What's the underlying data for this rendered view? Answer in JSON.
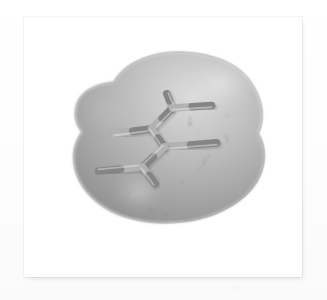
{
  "figure": {
    "kind": "molecular-surface-rendering",
    "caption": "",
    "alt_text": "Grayscale rendering of a molecular van der Waals surface enclosing a stick model of a branched alkane",
    "background_color": "#fefefe",
    "plate_background": "#ffffff",
    "frame": {
      "x": 24,
      "y": 17,
      "width": 278,
      "height": 260,
      "border_color": "#e8e8e8",
      "shadow_color": "rgba(0,0,0,0.12)"
    }
  },
  "surface": {
    "name": "van-der-waals-surface",
    "fill_light": "#cfcfcf",
    "fill_mid": "#a8a8a8",
    "fill_dark": "#8f8f8f",
    "edge_color": "#9a9a9a",
    "highlight_color": "#eaeaea",
    "outline_path": "M 104 72 C 118 48, 152 34, 190 36 C 228 38, 258 52, 272 76 C 284 96, 286 116, 278 134 C 288 150, 288 172, 276 192 C 260 218, 224 236, 186 240 C 146 244, 108 236, 84 216 C 66 201, 56 182, 56 162 C 56 150, 60 140, 66 132 C 58 122, 56 110, 60 98 C 66 82, 84 74, 104 72 Z",
    "highlights": [
      {
        "name": "upper-right-specular",
        "cx": 232,
        "cy": 74,
        "rx": 46,
        "ry": 34,
        "intensity": 0.72
      },
      {
        "name": "lower-center-specular",
        "cx": 134,
        "cy": 204,
        "rx": 30,
        "ry": 21,
        "intensity": 0.62
      },
      {
        "name": "left-lobe-soft",
        "cx": 92,
        "cy": 108,
        "rx": 34,
        "ry": 28,
        "intensity": 0.3
      }
    ]
  },
  "molecule": {
    "name": "stick-model",
    "bond_color_light": "#b2b2b2",
    "bond_color_dark": "#858585",
    "bond_width": 9,
    "atoms": [
      {
        "id": "C1",
        "label": "",
        "x": 104,
        "y": 134
      },
      {
        "id": "C2",
        "label": "",
        "x": 150,
        "y": 128
      },
      {
        "id": "C3",
        "label": "",
        "x": 175,
        "y": 103
      },
      {
        "id": "C4",
        "label": "",
        "x": 168,
        "y": 86
      },
      {
        "id": "C5",
        "label": "",
        "x": 222,
        "y": 100
      },
      {
        "id": "C6",
        "label": "",
        "x": 165,
        "y": 150
      },
      {
        "id": "C7",
        "label": "",
        "x": 228,
        "y": 145
      },
      {
        "id": "C8",
        "label": "",
        "x": 139,
        "y": 174
      },
      {
        "id": "C9",
        "label": "",
        "x": 86,
        "y": 179
      },
      {
        "id": "C10",
        "label": "",
        "x": 154,
        "y": 194
      }
    ],
    "bonds": [
      {
        "from": "C1",
        "to": "C2",
        "name": "bond-c1-c2"
      },
      {
        "from": "C2",
        "to": "C3",
        "name": "bond-c2-c3"
      },
      {
        "from": "C3",
        "to": "C4",
        "name": "bond-c3-c4"
      },
      {
        "from": "C3",
        "to": "C5",
        "name": "bond-c3-c5"
      },
      {
        "from": "C2",
        "to": "C6",
        "name": "bond-c2-c6"
      },
      {
        "from": "C6",
        "to": "C7",
        "name": "bond-c6-c7"
      },
      {
        "from": "C6",
        "to": "C8",
        "name": "bond-c6-c8"
      },
      {
        "from": "C8",
        "to": "C9",
        "name": "bond-c8-c9"
      },
      {
        "from": "C8",
        "to": "C10",
        "name": "bond-c8-c10"
      }
    ]
  },
  "artifacts": {
    "specks": [
      {
        "x": 197,
        "y": 122,
        "r": 1.1
      },
      {
        "x": 205,
        "y": 131,
        "r": 0.8
      },
      {
        "x": 219,
        "y": 160,
        "r": 1.0
      },
      {
        "x": 208,
        "y": 175,
        "r": 0.9
      },
      {
        "x": 186,
        "y": 193,
        "r": 1.0
      },
      {
        "x": 123,
        "y": 205,
        "r": 0.8
      },
      {
        "x": 104,
        "y": 186,
        "r": 0.7
      },
      {
        "x": 149,
        "y": 226,
        "r": 0.9
      },
      {
        "x": 168,
        "y": 231,
        "r": 0.8
      },
      {
        "x": 207,
        "y": 236,
        "r": 0.9
      },
      {
        "x": 94,
        "y": 226,
        "r": 0.7
      },
      {
        "x": 240,
        "y": 112,
        "r": 0.8
      }
    ],
    "hairlines": [
      {
        "x": 196,
        "y": 113,
        "w": 1,
        "h": 13,
        "rot": 8
      },
      {
        "x": 238,
        "y": 135,
        "w": 1,
        "h": 9,
        "rot": -22
      },
      {
        "x": 214,
        "y": 163,
        "w": 1,
        "h": 10,
        "rot": 14
      },
      {
        "x": 245,
        "y": 240,
        "w": 9,
        "h": 1,
        "rot": -6
      }
    ]
  }
}
